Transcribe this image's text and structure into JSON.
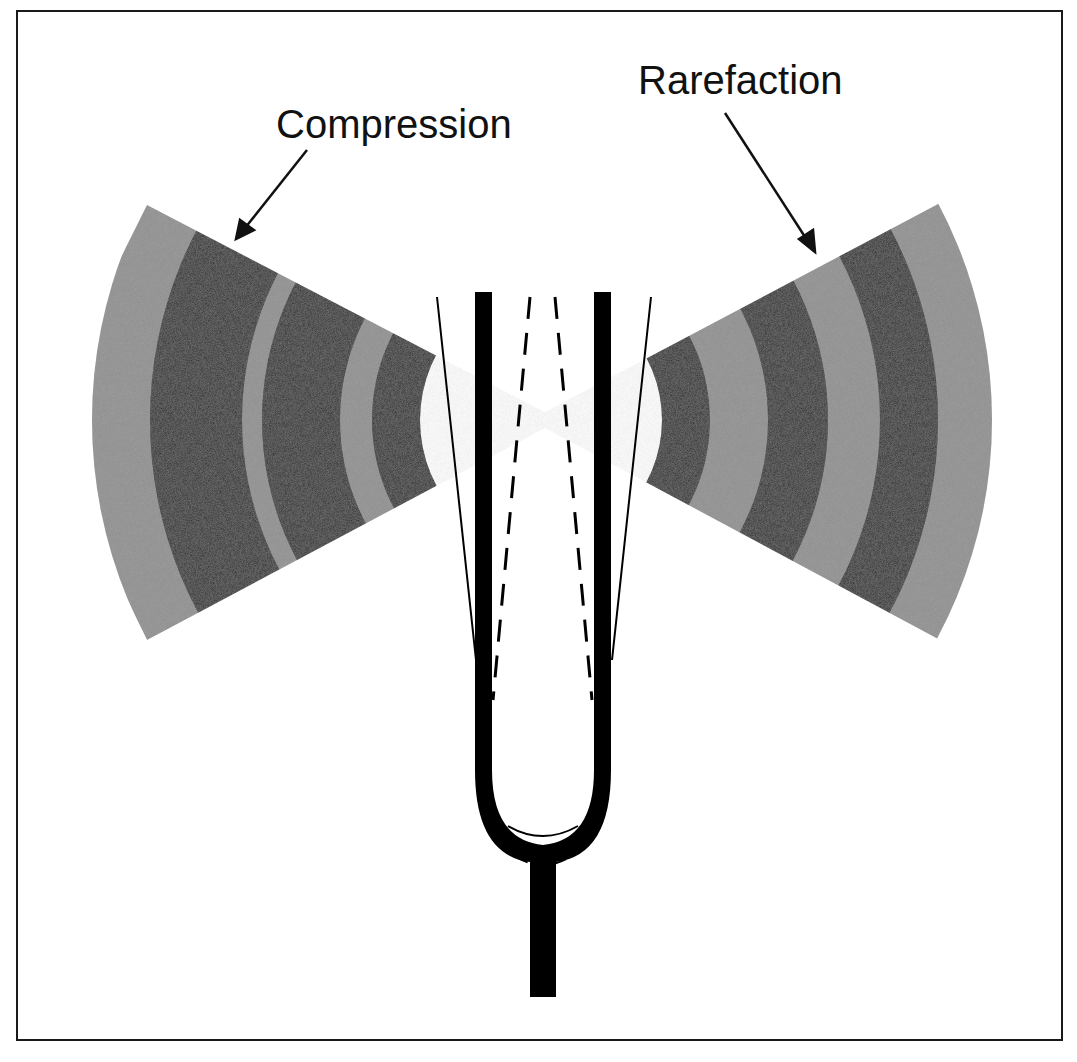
{
  "diagram": {
    "labels": {
      "compression": "Compression",
      "rarefaction": "Rarefaction"
    },
    "colors": {
      "compression_band": "#1e1e1e",
      "rarefaction_band": "#8c8c8c",
      "fork": "#000000",
      "frame": "#1a1a1a",
      "background": "#ffffff"
    },
    "wave_fronts": {
      "left_bands": 5,
      "right_bands": 6
    }
  }
}
